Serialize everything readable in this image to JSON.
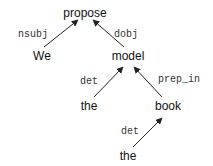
{
  "diagram": {
    "type": "dependency-tree",
    "nodes": [
      {
        "id": "propose",
        "label": "propose"
      },
      {
        "id": "we",
        "label": "We"
      },
      {
        "id": "model",
        "label": "model"
      },
      {
        "id": "the1",
        "label": "the"
      },
      {
        "id": "book",
        "label": "book"
      },
      {
        "id": "the2",
        "label": "the"
      }
    ],
    "edges": [
      {
        "from": "we",
        "to": "propose",
        "label": "nsubj"
      },
      {
        "from": "model",
        "to": "propose",
        "label": "dobj"
      },
      {
        "from": "the1",
        "to": "model",
        "label": "det"
      },
      {
        "from": "book",
        "to": "model",
        "label": "prep_in"
      },
      {
        "from": "the2",
        "to": "book",
        "label": "det"
      }
    ]
  }
}
